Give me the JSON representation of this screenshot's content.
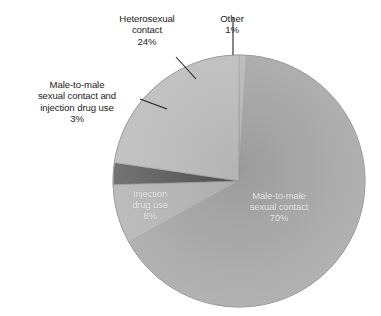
{
  "figure": {
    "background": "#ffffff",
    "width": 381,
    "height": 316
  },
  "chart_data": {
    "type": "pie",
    "title": "",
    "subtitle": "",
    "xlabel": "",
    "ylabel": "",
    "grid": false,
    "legend": "none",
    "label_format": "name + percent",
    "start_angle_deg": 0,
    "direction": "clockwise",
    "center": {
      "x": 239,
      "y": 181
    },
    "radius": 126,
    "categories": [
      "Other",
      "Male-to-male sexual contact",
      "Injection drug use",
      "Male-to-male sexual contact and injection drug use",
      "Heterosexual contact"
    ],
    "values": [
      1,
      70,
      8,
      3,
      24
    ],
    "unit": "%",
    "total": 106,
    "slices": [
      {
        "name": "Other",
        "value": 1,
        "percent_text": "1%",
        "color": "#b0b0b0",
        "label_placement": "outside",
        "leader": true
      },
      {
        "name": "Male-to-male sexual contact",
        "value": 70,
        "percent_text": "70%",
        "color": "#9b9b9b",
        "label_placement": "inside",
        "leader": false
      },
      {
        "name": "Injection drug use",
        "value": 8,
        "percent_text": "8%",
        "color": "#ababab",
        "label_placement": "inside",
        "leader": false
      },
      {
        "name": "Male-to-male sexual contact and injection drug use",
        "value": 3,
        "percent_text": "3%",
        "color": "#4b4b4b",
        "label_placement": "outside",
        "leader": true
      },
      {
        "name": "Heterosexual contact",
        "value": 24,
        "percent_text": "24%",
        "color": "#b4b4b4",
        "label_placement": "outside",
        "leader": true
      }
    ]
  },
  "labels": {
    "heterosexual": "Heterosexual\ncontact\n24%",
    "other": "Other\n1%",
    "mtm_idu": "Male-to-male\nsexual contact and\ninjection drug use\n3%",
    "injection_inner": "Injection\ndrug use\n8%",
    "mtm_inner": "Male-to-male\nsexual contact\n70%"
  },
  "colors": {
    "slice_large": "#9b9b9b",
    "slice_heterosexual": "#b4b4b4",
    "slice_other": "#b0b0b0",
    "slice_injection": "#ababab",
    "slice_dark": "#4b4b4b",
    "outline": "#8e8e8e",
    "leader_line": "#1c1c1c",
    "label_text": "#1c1c1c",
    "inner_label_text": "#f2f2f2"
  }
}
